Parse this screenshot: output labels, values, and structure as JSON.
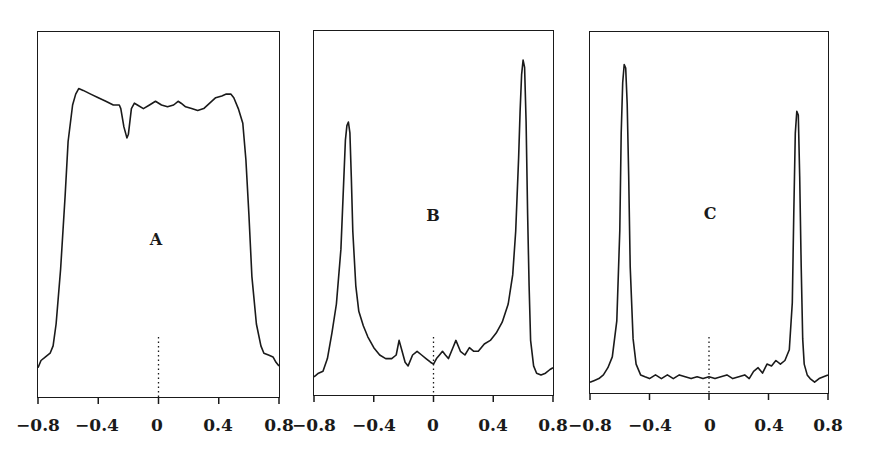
{
  "chart_data": [
    {
      "type": "line",
      "panel": "A",
      "title": "",
      "label": "A",
      "xlabel": "",
      "ylabel": "",
      "xlim": [
        -0.8,
        0.8
      ],
      "ylim": [
        0,
        1
      ],
      "x_ticks": [
        "-0.8",
        "-0.4",
        "0",
        "0.4",
        "0.8"
      ],
      "grid": false,
      "zero_line": "dotted",
      "x": [
        -0.8,
        -0.78,
        -0.75,
        -0.72,
        -0.7,
        -0.68,
        -0.65,
        -0.62,
        -0.6,
        -0.57,
        -0.55,
        -0.53,
        -0.5,
        -0.45,
        -0.4,
        -0.35,
        -0.3,
        -0.26,
        -0.25,
        -0.23,
        -0.21,
        -0.2,
        -0.18,
        -0.16,
        -0.14,
        -0.1,
        -0.06,
        -0.02,
        0.02,
        0.06,
        0.1,
        0.13,
        0.15,
        0.18,
        0.22,
        0.26,
        0.3,
        0.34,
        0.38,
        0.42,
        0.45,
        0.48,
        0.5,
        0.53,
        0.56,
        0.58,
        0.6,
        0.62,
        0.65,
        0.68,
        0.7,
        0.73,
        0.76,
        0.78,
        0.8
      ],
      "values": [
        0.08,
        0.1,
        0.11,
        0.12,
        0.14,
        0.2,
        0.35,
        0.55,
        0.7,
        0.8,
        0.83,
        0.845,
        0.84,
        0.83,
        0.82,
        0.81,
        0.8,
        0.8,
        0.79,
        0.74,
        0.71,
        0.72,
        0.79,
        0.805,
        0.8,
        0.79,
        0.8,
        0.81,
        0.8,
        0.795,
        0.8,
        0.81,
        0.805,
        0.795,
        0.79,
        0.785,
        0.79,
        0.805,
        0.82,
        0.825,
        0.83,
        0.83,
        0.82,
        0.79,
        0.75,
        0.65,
        0.5,
        0.33,
        0.2,
        0.14,
        0.12,
        0.115,
        0.11,
        0.095,
        0.085
      ]
    },
    {
      "type": "line",
      "panel": "B",
      "title": "",
      "label": "B",
      "xlabel": "",
      "ylabel": "",
      "xlim": [
        -0.8,
        0.8
      ],
      "ylim": [
        0,
        1
      ],
      "x_ticks": [
        "-0.8",
        "-0.4",
        "0",
        "0.4",
        "0.8"
      ],
      "grid": false,
      "zero_line": "dotted",
      "x": [
        -0.8,
        -0.77,
        -0.74,
        -0.71,
        -0.68,
        -0.65,
        -0.62,
        -0.6,
        -0.59,
        -0.58,
        -0.57,
        -0.56,
        -0.55,
        -0.54,
        -0.52,
        -0.5,
        -0.47,
        -0.44,
        -0.4,
        -0.36,
        -0.32,
        -0.28,
        -0.25,
        -0.23,
        -0.21,
        -0.19,
        -0.17,
        -0.14,
        -0.11,
        -0.08,
        -0.05,
        -0.02,
        0,
        0.02,
        0.04,
        0.06,
        0.08,
        0.1,
        0.13,
        0.15,
        0.18,
        0.21,
        0.24,
        0.27,
        0.3,
        0.34,
        0.38,
        0.42,
        0.46,
        0.5,
        0.53,
        0.55,
        0.57,
        0.58,
        0.59,
        0.6,
        0.61,
        0.62,
        0.63,
        0.64,
        0.65,
        0.67,
        0.69,
        0.72,
        0.75,
        0.78,
        0.8
      ],
      "values": [
        0.05,
        0.06,
        0.065,
        0.1,
        0.17,
        0.25,
        0.4,
        0.6,
        0.7,
        0.74,
        0.75,
        0.72,
        0.6,
        0.45,
        0.3,
        0.23,
        0.19,
        0.16,
        0.13,
        0.11,
        0.1,
        0.1,
        0.11,
        0.15,
        0.12,
        0.09,
        0.08,
        0.11,
        0.12,
        0.11,
        0.1,
        0.09,
        0.085,
        0.1,
        0.11,
        0.12,
        0.11,
        0.1,
        0.13,
        0.15,
        0.12,
        0.11,
        0.13,
        0.12,
        0.12,
        0.14,
        0.15,
        0.17,
        0.2,
        0.25,
        0.33,
        0.45,
        0.65,
        0.78,
        0.88,
        0.92,
        0.9,
        0.75,
        0.5,
        0.3,
        0.15,
        0.08,
        0.06,
        0.055,
        0.06,
        0.07,
        0.075
      ]
    },
    {
      "type": "line",
      "panel": "C",
      "title": "",
      "label": "C",
      "xlabel": "",
      "ylabel": "",
      "xlim": [
        -0.8,
        0.8
      ],
      "ylim": [
        0,
        1
      ],
      "x_ticks": [
        "-0.8",
        "-0.4",
        "0",
        "0.4",
        "0.8"
      ],
      "grid": false,
      "zero_line": "dotted",
      "x": [
        -0.8,
        -0.77,
        -0.74,
        -0.71,
        -0.68,
        -0.65,
        -0.62,
        -0.6,
        -0.59,
        -0.58,
        -0.57,
        -0.56,
        -0.55,
        -0.54,
        -0.53,
        -0.51,
        -0.49,
        -0.46,
        -0.43,
        -0.4,
        -0.36,
        -0.32,
        -0.28,
        -0.24,
        -0.2,
        -0.16,
        -0.12,
        -0.08,
        -0.04,
        0,
        0.04,
        0.08,
        0.12,
        0.16,
        0.2,
        0.24,
        0.27,
        0.3,
        0.33,
        0.36,
        0.39,
        0.42,
        0.45,
        0.48,
        0.51,
        0.54,
        0.56,
        0.57,
        0.58,
        0.59,
        0.6,
        0.61,
        0.62,
        0.63,
        0.64,
        0.66,
        0.68,
        0.71,
        0.74,
        0.77,
        0.8
      ],
      "values": [
        0.03,
        0.035,
        0.04,
        0.05,
        0.07,
        0.1,
        0.2,
        0.45,
        0.72,
        0.86,
        0.91,
        0.9,
        0.8,
        0.6,
        0.35,
        0.15,
        0.08,
        0.05,
        0.045,
        0.04,
        0.05,
        0.04,
        0.05,
        0.04,
        0.05,
        0.045,
        0.04,
        0.045,
        0.04,
        0.045,
        0.04,
        0.045,
        0.05,
        0.04,
        0.045,
        0.05,
        0.04,
        0.06,
        0.07,
        0.055,
        0.08,
        0.075,
        0.09,
        0.08,
        0.09,
        0.12,
        0.25,
        0.5,
        0.72,
        0.78,
        0.77,
        0.6,
        0.35,
        0.15,
        0.08,
        0.05,
        0.04,
        0.03,
        0.04,
        0.045,
        0.05
      ]
    }
  ],
  "panels": [
    {
      "label": "A",
      "ticks": [
        "−0.8",
        "−0.4",
        "0",
        "0.4",
        "0.8"
      ]
    },
    {
      "label": "B",
      "ticks": [
        "−0.8",
        "−0.4",
        "0",
        "0.4",
        "0.8"
      ]
    },
    {
      "label": "C",
      "ticks": [
        "−0.8",
        "−0.4",
        "0",
        "0.4",
        "0.8"
      ]
    }
  ],
  "colors": {
    "line": "#1a1a1a",
    "frame": "#1a1a1a",
    "background": "#ffffff"
  }
}
